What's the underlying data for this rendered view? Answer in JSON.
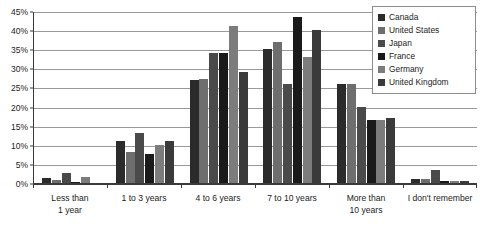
{
  "chart_data": {
    "type": "bar",
    "title": "",
    "subtitle": "",
    "xlabel": "",
    "ylabel": "",
    "ylim": [
      0,
      45
    ],
    "ytick_step": 5,
    "ytick_labels": [
      "0%",
      "5%",
      "10%",
      "15%",
      "20%",
      "25%",
      "30%",
      "35%",
      "40%",
      "45%"
    ],
    "ytick_values": [
      0,
      5,
      10,
      15,
      20,
      25,
      30,
      35,
      40,
      45
    ],
    "grid": true,
    "legend_position": "top-right",
    "categories": [
      "Less than 1 year",
      "1 to 3 years",
      "4 to 6 years",
      "7 to 10 years",
      "More than 10 years",
      "I don't remember"
    ],
    "category_lines": [
      [
        "Less than",
        "1 year"
      ],
      [
        "1 to 3 years"
      ],
      [
        "4 to 6 years"
      ],
      [
        "7 to 10 years"
      ],
      [
        "More than",
        "10 years"
      ],
      [
        "I don't remember"
      ]
    ],
    "series": [
      {
        "name": "Canada",
        "color": "#2b2b2b",
        "values": [
          1.2,
          11.0,
          27.0,
          35.0,
          26.0,
          1.0
        ]
      },
      {
        "name": "United States",
        "color": "#6e6e6e",
        "values": [
          0.8,
          8.0,
          27.2,
          37.0,
          26.0,
          1.0
        ]
      },
      {
        "name": "Japan",
        "color": "#4a4a4a",
        "values": [
          2.6,
          13.0,
          34.0,
          26.0,
          20.0,
          3.5
        ]
      },
      {
        "name": "France",
        "color": "#1a1a1a",
        "values": [
          0.2,
          7.5,
          34.0,
          43.5,
          16.5,
          0.5
        ]
      },
      {
        "name": "Germany",
        "color": "#7c7c7c",
        "values": [
          1.5,
          10.0,
          41.0,
          33.0,
          16.5,
          0.4
        ]
      },
      {
        "name": "United Kingdom",
        "color": "#3a3a3a",
        "values": [
          0.1,
          11.0,
          29.0,
          40.0,
          17.0,
          0.4
        ]
      }
    ]
  },
  "legend": {
    "items": [
      {
        "label": "Canada"
      },
      {
        "label": "United States"
      },
      {
        "label": "Japan"
      },
      {
        "label": "France"
      },
      {
        "label": "Germany"
      },
      {
        "label": "United Kingdom"
      }
    ]
  },
  "colors": {
    "axis": "#3a3a3a",
    "gridline": "#9a9a9a",
    "text": "#1c1c1c",
    "background": "#ffffff",
    "legend_border": "#8c8c8c"
  }
}
